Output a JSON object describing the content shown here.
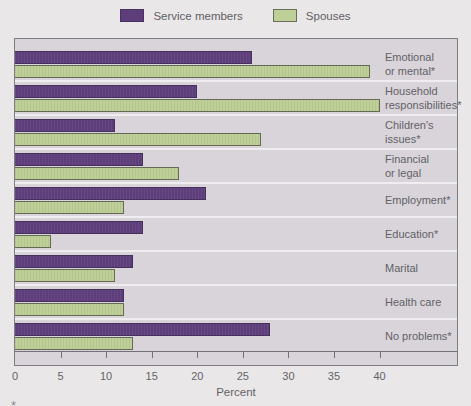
{
  "legend": {
    "items": [
      {
        "label": "Service members",
        "color": "#5d3e7b"
      },
      {
        "label": "Spouses",
        "color": "#bed098"
      }
    ]
  },
  "chart_data": {
    "type": "bar",
    "orientation": "horizontal",
    "title": "",
    "xlabel": "Percent",
    "xlim": [
      0,
      48.5
    ],
    "xticks": [
      0,
      5,
      10,
      15,
      20,
      25,
      30,
      35,
      40
    ],
    "categories": [
      "Emotional\nor mental*",
      "Household\nresponsibilities*",
      "Children's\nissues*",
      "Financial\nor legal",
      "Employment*",
      "Education*",
      "Marital",
      "Health care",
      "No problems*"
    ],
    "series": [
      {
        "name": "Service members",
        "color": "#5d3e7b",
        "values": [
          26,
          20,
          11,
          14,
          21,
          14,
          13,
          12,
          28
        ]
      },
      {
        "name": "Spouses",
        "color": "#bed098",
        "values": [
          39,
          40,
          27,
          18,
          12,
          4,
          11,
          12,
          13
        ]
      }
    ],
    "legend_position": "top-center",
    "plot_background": "#d8d4d9",
    "band_separator_color": "#f0edf0"
  },
  "footnote": {
    "marker": "*"
  }
}
